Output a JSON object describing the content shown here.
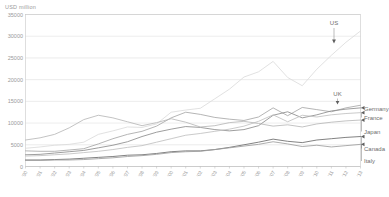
{
  "chart_data": {
    "type": "line",
    "title": "",
    "subtitle": "",
    "ylabel": "USD million",
    "xlabel": "",
    "ylim": [
      0,
      35000
    ],
    "ytick_values": [
      0,
      5000,
      10000,
      15000,
      20000,
      25000,
      30000,
      35000
    ],
    "ytick_labels": [
      "0",
      "5000",
      "10000",
      "15000",
      "20000",
      "25000",
      "30000",
      "35000"
    ],
    "grid": "horizontal",
    "legend_position": "right-inline-callouts",
    "categories": [
      "'90",
      "'91",
      "'92",
      "'93",
      "'94",
      "'95",
      "'96",
      "'97",
      "'98",
      "'99",
      "'00",
      "'01",
      "'02",
      "'03",
      "'04",
      "'05",
      "'06",
      "'07",
      "'08",
      "'09",
      "'10",
      "'11",
      "'12",
      "'13"
    ],
    "series": [
      {
        "name": "US",
        "color": "#dcdcdc",
        "label_position": "top-arrow",
        "values": [
          4200,
          4500,
          4900,
          5100,
          5600,
          7400,
          8200,
          9100,
          9000,
          9800,
          12500,
          13000,
          13400,
          15600,
          17800,
          20600,
          21800,
          24200,
          20500,
          18600,
          22400,
          25600,
          28600,
          31200
        ]
      },
      {
        "name": "UK",
        "color": "#a8a8a8",
        "label_position": "right-callout",
        "values": [
          3600,
          3500,
          3500,
          3800,
          4100,
          5200,
          6400,
          7400,
          8100,
          9300,
          11200,
          12500,
          12000,
          11300,
          10900,
          10600,
          11400,
          13500,
          11700,
          13600,
          13100,
          12600,
          13500,
          14100
        ]
      },
      {
        "name": "Germany",
        "color": "#8d8d8d",
        "label_position": "right-callout",
        "values": [
          2700,
          2800,
          3100,
          3400,
          3700,
          4300,
          4900,
          5700,
          6900,
          7900,
          8600,
          9200,
          9000,
          8500,
          8200,
          8500,
          9400,
          11800,
          12600,
          11200,
          11900,
          12800,
          13200,
          13500
        ]
      },
      {
        "name": "France",
        "color": "#c0c0c0",
        "label_position": "right-callout",
        "values": [
          2400,
          2500,
          2700,
          2900,
          3200,
          3500,
          3900,
          4400,
          4800,
          5600,
          6400,
          7200,
          7600,
          8100,
          8600,
          9300,
          10400,
          11900,
          10300,
          11800,
          11400,
          11900,
          12200,
          12400
        ]
      },
      {
        "name": "Japan",
        "color": "#b8b8b8",
        "label_position": "right-callout",
        "values": [
          6100,
          6600,
          7400,
          8900,
          10800,
          11800,
          11200,
          10300,
          9400,
          10100,
          11000,
          10200,
          9100,
          9400,
          10100,
          10400,
          9900,
          9300,
          9600,
          9100,
          9800,
          10200,
          10500,
          10700
        ]
      },
      {
        "name": "Canada",
        "color": "#6b6b6b",
        "label_position": "right-callout",
        "values": [
          1500,
          1500,
          1600,
          1700,
          1900,
          2100,
          2300,
          2600,
          2700,
          3000,
          3400,
          3600,
          3600,
          3900,
          4400,
          5000,
          5600,
          6300,
          5800,
          5500,
          6100,
          6400,
          6700,
          6900
        ]
      },
      {
        "name": "Italy",
        "color": "#9e9e9e",
        "label_position": "right-callout",
        "values": [
          1400,
          1400,
          1500,
          1500,
          1600,
          1800,
          2000,
          2300,
          2500,
          2800,
          3200,
          3400,
          3500,
          3900,
          4300,
          4700,
          5100,
          5700,
          5200,
          4600,
          4900,
          4500,
          4800,
          5100
        ]
      }
    ]
  }
}
